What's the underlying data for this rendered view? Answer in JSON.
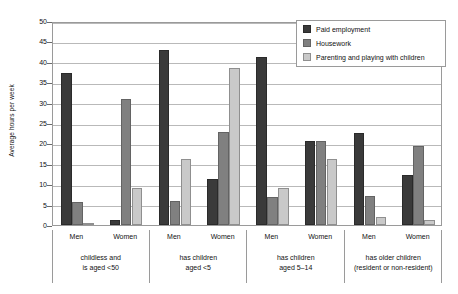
{
  "chart_data": {
    "type": "bar",
    "title": "",
    "subtitle": "",
    "xlabel": "",
    "ylabel": "Average hours per week",
    "ylim": [
      0,
      50
    ],
    "yticks": [
      0,
      5,
      10,
      15,
      20,
      25,
      30,
      35,
      40,
      45,
      50
    ],
    "grid": true,
    "legend_position": "top-right",
    "legend": [
      "Paid employment",
      "Housework",
      "Parenting and playing with children"
    ],
    "categories": [
      "Men (childless and is aged <50)",
      "Women (childless and is aged <50)",
      "Men (has children aged <5)",
      "Women (has children aged <5)",
      "Men (has children aged 5–14)",
      "Women (has children aged 5–14)",
      "Men (has older children (resident or non-resident))",
      "Women (has older children (resident or non-resident))"
    ],
    "series": [
      {
        "name": "Paid employment",
        "color": "#3a3a3a",
        "values": [
          37.3,
          1.3,
          43.0,
          11.2,
          41.2,
          20.5,
          22.5,
          12.3
        ]
      },
      {
        "name": "Housework",
        "color": "#808080",
        "values": [
          5.7,
          30.8,
          5.8,
          22.8,
          6.8,
          20.5,
          7.0,
          19.3
        ]
      },
      {
        "name": "Parenting and playing with children",
        "color": "#c9c9c9",
        "values": [
          0.4,
          9.0,
          16.2,
          38.5,
          9.0,
          16.2,
          2.0,
          1.2
        ]
      }
    ],
    "groups": [
      {
        "label_line1": "childless and",
        "label_line2": "is aged <50",
        "sexes": [
          "Men",
          "Women"
        ]
      },
      {
        "label_line1": "has children",
        "label_line2": "aged <5",
        "sexes": [
          "Men",
          "Women"
        ]
      },
      {
        "label_line1": "has children",
        "label_line2": "aged 5–14",
        "sexes": [
          "Men",
          "Women"
        ]
      },
      {
        "label_line1": "has older children",
        "label_line2": "(resident or non-resident)",
        "sexes": [
          "Men",
          "Women"
        ]
      }
    ]
  }
}
